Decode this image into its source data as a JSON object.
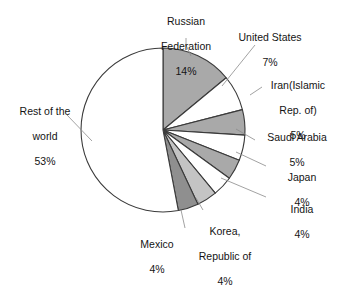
{
  "chart_data": {
    "type": "pie",
    "title": "",
    "subtitle": "",
    "xlabel": "",
    "ylabel": "",
    "legend_position": "none",
    "grid": false,
    "units": "percent",
    "start_angle_deg": 0,
    "direction": "clockwise",
    "categories": [
      "Russian Federation",
      "United States",
      "Iran(Islamic Rep. of)",
      "Saudi Arabia",
      "Japan",
      "India",
      "Korea, Republic of",
      "Mexico",
      "Rest of the world"
    ],
    "values": [
      14,
      7,
      5,
      5,
      4,
      4,
      4,
      4,
      53
    ],
    "slices": [
      {
        "label": "Russian Federation",
        "label_lines": [
          "Russian",
          "Federation"
        ],
        "value": 14,
        "value_text": "14%",
        "fill": "#a9a9a9"
      },
      {
        "label": "United States",
        "label_lines": [
          "United States"
        ],
        "value": 7,
        "value_text": "7%",
        "fill": "#ffffff"
      },
      {
        "label": "Iran(Islamic Rep. of)",
        "label_lines": [
          "Iran(Islamic",
          "Rep. of)"
        ],
        "value": 5,
        "value_text": "5%",
        "fill": "#a9a9a9"
      },
      {
        "label": "Saudi Arabia",
        "label_lines": [
          "Saudi Arabia"
        ],
        "value": 5,
        "value_text": "5%",
        "fill": "#ffffff"
      },
      {
        "label": "Japan",
        "label_lines": [
          "Japan"
        ],
        "value": 4,
        "value_text": "4%",
        "fill": "#a9a9a9"
      },
      {
        "label": "India",
        "label_lines": [
          "India"
        ],
        "value": 4,
        "value_text": "4%",
        "fill": "#ffffff"
      },
      {
        "label": "Korea, Republic of",
        "label_lines": [
          "Korea,",
          "Republic of"
        ],
        "value": 4,
        "value_text": "4%",
        "fill": "#c4c4c4"
      },
      {
        "label": "Mexico",
        "label_lines": [
          "Mexico"
        ],
        "value": 4,
        "value_text": "4%",
        "fill": "#8f8f8f"
      },
      {
        "label": "Rest of the world",
        "label_lines": [
          "Rest of the",
          "world"
        ],
        "value": 53,
        "value_text": "53%",
        "fill": "#ffffff"
      }
    ],
    "geometry": {
      "center_x": 163,
      "center_y": 130,
      "radius": 82
    },
    "colors": {
      "outline": "#3a3a3a",
      "leader_line": "#8a8a8a",
      "text": "#141414",
      "background": "#ffffff"
    }
  },
  "labels": {
    "russian_federation": {
      "line1": "Russian",
      "line2": "Federation",
      "pct": "14%"
    },
    "united_states": {
      "line1": "United States",
      "line2": "",
      "pct": "7%"
    },
    "iran": {
      "line1": "Iran(Islamic",
      "line2": "Rep. of)",
      "pct": "5%"
    },
    "saudi_arabia": {
      "line1": "Saudi Arabia",
      "line2": "",
      "pct": "5%"
    },
    "japan": {
      "line1": "Japan",
      "line2": "",
      "pct": "4%"
    },
    "india": {
      "line1": "India",
      "line2": "",
      "pct": "4%"
    },
    "korea": {
      "line1": "Korea,",
      "line2": "Republic of",
      "pct": "4%"
    },
    "mexico": {
      "line1": "Mexico",
      "line2": "",
      "pct": "4%"
    },
    "rest_of_the_world": {
      "line1": "Rest of the",
      "line2": "world",
      "pct": "53%"
    }
  }
}
